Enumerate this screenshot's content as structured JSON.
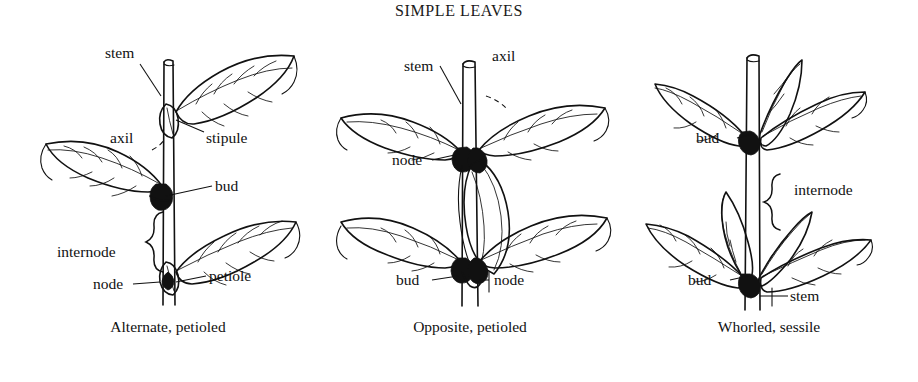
{
  "figure": {
    "title": "SIMPLE LEAVES",
    "background": "#ffffff",
    "ink": "#111111"
  },
  "panels": [
    {
      "id": "alternate",
      "caption": "Alternate, petioled",
      "labels": [
        {
          "name": "stem",
          "text": "stem"
        },
        {
          "name": "axil",
          "text": "axil"
        },
        {
          "name": "stipule",
          "text": "stipule"
        },
        {
          "name": "bud",
          "text": "bud"
        },
        {
          "name": "internode",
          "text": "internode"
        },
        {
          "name": "node",
          "text": "node"
        },
        {
          "name": "petiole",
          "text": "petiole"
        }
      ]
    },
    {
      "id": "opposite",
      "caption": "Opposite, petioled",
      "labels": [
        {
          "name": "stem",
          "text": "stem"
        },
        {
          "name": "axil",
          "text": "axil"
        },
        {
          "name": "node-upper",
          "text": "node"
        },
        {
          "name": "bud",
          "text": "bud"
        },
        {
          "name": "node-lower",
          "text": "node"
        }
      ]
    },
    {
      "id": "whorled",
      "caption": "Whorled, sessile",
      "labels": [
        {
          "name": "bud-upper",
          "text": "bud"
        },
        {
          "name": "internode",
          "text": "internode"
        },
        {
          "name": "bud-lower",
          "text": "bud"
        },
        {
          "name": "stem",
          "text": "stem"
        }
      ]
    }
  ]
}
